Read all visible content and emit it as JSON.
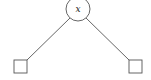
{
  "diagram": {
    "type": "binary-tree",
    "colors": {
      "stroke": "#555555",
      "background": "#ffffff",
      "text": "#222222"
    },
    "root": {
      "label": "x",
      "shape": "circle",
      "cx": 78,
      "cy": 9,
      "r": 12
    },
    "children": [
      {
        "label": "",
        "shape": "square",
        "x": 14,
        "y": 60,
        "w": 13,
        "h": 13,
        "position": "left"
      },
      {
        "label": "",
        "shape": "square",
        "x": 129,
        "y": 60,
        "w": 13,
        "h": 13,
        "position": "right"
      }
    ],
    "edges": [
      {
        "from": "root",
        "to": "left-leaf",
        "x1": 70,
        "y1": 18,
        "x2": 27,
        "y2": 60
      },
      {
        "from": "root",
        "to": "right-leaf",
        "x1": 86,
        "y1": 18,
        "x2": 129,
        "y2": 60
      }
    ]
  }
}
